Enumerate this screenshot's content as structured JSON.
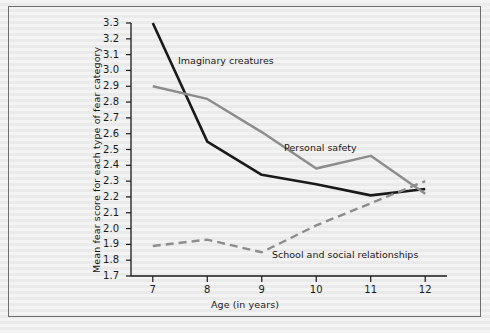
{
  "chart_data": {
    "type": "line",
    "title": "",
    "xlabel": "Age (in years)",
    "ylabel": "Mean fear score for each type of fear category",
    "x": [
      7,
      8,
      9,
      10,
      11,
      12
    ],
    "xticklabels": [
      "7",
      "8",
      "9",
      "10",
      "11",
      "12"
    ],
    "xlim": [
      6.6,
      12.4
    ],
    "ylim": [
      1.7,
      3.3
    ],
    "yticks": [
      1.7,
      1.8,
      1.9,
      2.0,
      2.1,
      2.2,
      2.3,
      2.4,
      2.5,
      2.6,
      2.7,
      2.8,
      2.9,
      3.0,
      3.1,
      3.2,
      3.3
    ],
    "yticklabels": [
      "1.7",
      "1.8",
      "1.9",
      "2.0",
      "2.1",
      "2.2",
      "2.3",
      "2.4",
      "2.5",
      "2.6",
      "2.7",
      "2.8",
      "2.9",
      "3.0",
      "3.1",
      "3.2",
      "3.3"
    ],
    "grid": false,
    "legend_position": "inline-annotations",
    "series": [
      {
        "name": "Imaginary creatures",
        "values": [
          3.3,
          2.55,
          2.34,
          2.28,
          2.21,
          2.25
        ],
        "color": "#1a1a1a",
        "style": "solid",
        "width": 2.6,
        "label_x": 178,
        "label_y": 55
      },
      {
        "name": "Personal safety",
        "values": [
          2.9,
          2.82,
          2.61,
          2.38,
          2.46,
          2.22
        ],
        "color": "#8c8c8c",
        "style": "solid",
        "width": 2.4,
        "label_x": 284,
        "label_y": 142
      },
      {
        "name": "School and social relationships",
        "values": [
          1.89,
          1.93,
          1.85,
          2.02,
          2.16,
          2.3
        ],
        "color": "#8c8c8c",
        "style": "dashed",
        "width": 2.4,
        "label_x": 272,
        "label_y": 249
      }
    ]
  },
  "figure": {
    "background_color": "#f0f0f0",
    "border_color": "#6e6e6e",
    "axis_color": "#1a1a1a"
  }
}
